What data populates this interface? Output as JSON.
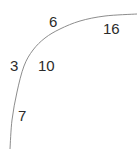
{
  "figure": {
    "background_color": "#ffffff",
    "width": 137,
    "height": 149
  },
  "chart_data": {
    "type": "line",
    "title": "",
    "xlabel": "",
    "ylabel": "",
    "grid": false,
    "legend_position": "none",
    "axis_visible": false,
    "xlim": [
      0,
      137
    ],
    "ylim": [
      0,
      149
    ],
    "curve": {
      "name": "concave-increasing-curve",
      "color": "#8d8d8d",
      "line_width": 1,
      "style": "solid",
      "points": [
        {
          "x": 10,
          "y": 149
        },
        {
          "x": 12,
          "y": 120
        },
        {
          "x": 17,
          "y": 92
        },
        {
          "x": 24,
          "y": 66
        },
        {
          "x": 33,
          "y": 50
        },
        {
          "x": 45,
          "y": 38
        },
        {
          "x": 60,
          "y": 29
        },
        {
          "x": 80,
          "y": 21
        },
        {
          "x": 105,
          "y": 16
        },
        {
          "x": 137,
          "y": 14
        }
      ]
    },
    "annotations": [
      {
        "id": "label-6",
        "text": "6",
        "x": 49,
        "y": 14
      },
      {
        "id": "label-16",
        "text": "16",
        "x": 103,
        "y": 21
      },
      {
        "id": "label-3",
        "text": "3",
        "x": 10,
        "y": 58
      },
      {
        "id": "label-10",
        "text": "10",
        "x": 38,
        "y": 58
      },
      {
        "id": "label-7",
        "text": "7",
        "x": 18,
        "y": 108
      }
    ],
    "values": [
      6,
      16,
      3,
      10,
      7
    ],
    "labels": [
      "6",
      "16",
      "3",
      "10",
      "7"
    ],
    "text_color": "#2b2b2b",
    "font_size_px": 15
  }
}
